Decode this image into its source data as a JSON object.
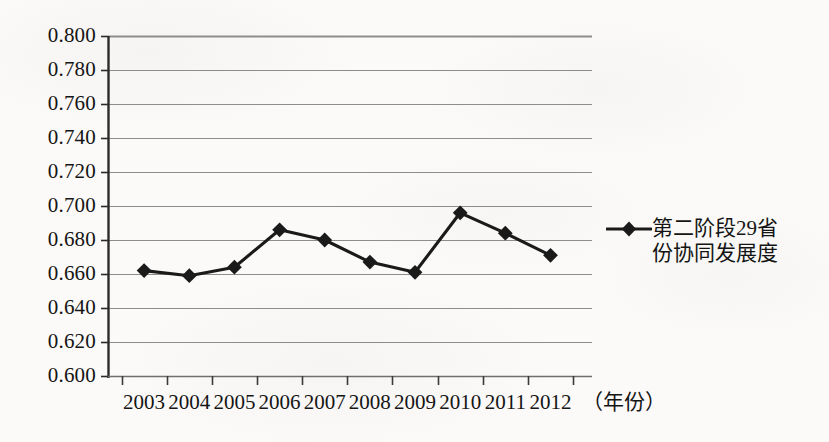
{
  "chart_data": {
    "type": "line",
    "title": "",
    "subtitle": "",
    "xlabel": "（年份）",
    "ylabel": "",
    "categories": [
      "2003",
      "2004",
      "2005",
      "2006",
      "2007",
      "2008",
      "2009",
      "2010",
      "2011",
      "2012"
    ],
    "series": [
      {
        "name": "第二阶段29省份协同发展度",
        "values": [
          0.662,
          0.659,
          0.664,
          0.686,
          0.68,
          0.667,
          0.661,
          0.696,
          0.684,
          0.671
        ],
        "color": "#1a1a1a",
        "marker": "diamond"
      }
    ],
    "ylim": [
      0.6,
      0.8
    ],
    "ytick_labels": [
      "0.800",
      "0.780",
      "0.760",
      "0.740",
      "0.720",
      "0.700",
      "0.680",
      "0.660",
      "0.640",
      "0.620",
      "0.600"
    ],
    "ytick_values": [
      0.8,
      0.78,
      0.76,
      0.74,
      0.72,
      0.7,
      0.68,
      0.66,
      0.64,
      0.62,
      0.6
    ],
    "grid": true,
    "grid_axis": "y",
    "legend_position": "right",
    "legend_entries": [
      {
        "label_line_1": "第二阶段29省",
        "label_line_2": "份协同发展度"
      }
    ]
  },
  "colors": {
    "background": "#fbfaf8",
    "axis": "#2b2b2b",
    "gridline": "#8d8d8d",
    "series": "#1a1a1a",
    "text": "#151515"
  }
}
